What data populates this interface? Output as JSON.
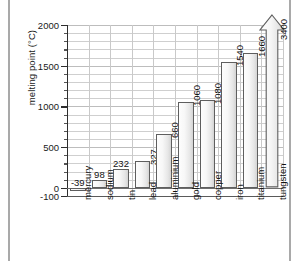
{
  "chart_data": {
    "type": "bar",
    "title": "",
    "xlabel": "",
    "ylabel": "melting point (°C)",
    "ylim": [
      -100,
      2000
    ],
    "ytick_labels": [
      "2000",
      "1500",
      "1000",
      "500",
      "0",
      "-100"
    ],
    "ytick_values": [
      2000,
      1500,
      1000,
      500,
      0,
      -100
    ],
    "grid": "horizontal-and-vertical",
    "legend": "none",
    "categories": [
      "mercury",
      "sodium",
      "tin",
      "lead",
      "aluminium",
      "gold",
      "copper",
      "iron",
      "titanium",
      "tungsten"
    ],
    "values": [
      -39,
      98,
      232,
      327,
      660,
      1060,
      1080,
      1540,
      1660,
      3400
    ],
    "value_labels": [
      "-39",
      "98",
      "232",
      "327",
      "660",
      "1060",
      "1080",
      "1540",
      "1660",
      "3400"
    ],
    "annotations": [
      {
        "category": "tungsten",
        "note": "bar drawn with upward arrowhead because value 3400 exceeds axis maximum of 2000"
      }
    ],
    "colors": {
      "bar_fill_light": "#fdfdfd",
      "bar_fill_dark": "#d4d4d4",
      "bar_stroke": "#5e5e5e",
      "grid": "#cfcfcf",
      "axis": "#2e2e2e",
      "text": "#111111",
      "frame": "#a9a9a9"
    }
  },
  "axis": {
    "y_label": "melting point (°C)",
    "ticks": [
      {
        "label": "2000"
      },
      {
        "label": "1500"
      },
      {
        "label": "1000"
      },
      {
        "label": "500"
      },
      {
        "label": "0"
      },
      {
        "label": "-100"
      }
    ]
  },
  "bars": [
    {
      "label": "mercury",
      "value_label": "-39"
    },
    {
      "label": "sodium",
      "value_label": "98"
    },
    {
      "label": "tin",
      "value_label": "232"
    },
    {
      "label": "lead",
      "value_label": "327"
    },
    {
      "label": "aluminium",
      "value_label": "660"
    },
    {
      "label": "gold",
      "value_label": "1060"
    },
    {
      "label": "copper",
      "value_label": "1080"
    },
    {
      "label": "iron",
      "value_label": "1540"
    },
    {
      "label": "titanium",
      "value_label": "1660"
    },
    {
      "label": "tungsten",
      "value_label": "3400"
    }
  ]
}
